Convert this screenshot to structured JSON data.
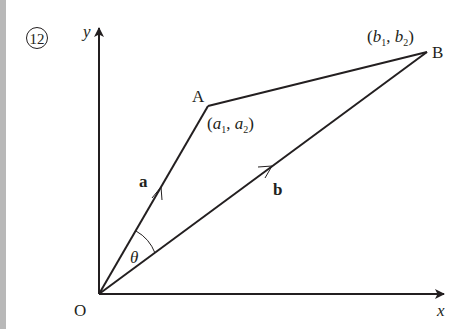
{
  "figure": {
    "number_label": "12",
    "axes": {
      "x_label": "x",
      "y_label": "y",
      "origin_label": "O"
    },
    "points": {
      "A": {
        "label": "A",
        "coord_label": {
          "open": "(",
          "v1": "a",
          "s1": "1",
          "sep": ", ",
          "v2": "a",
          "s2": "2",
          "close": ")"
        }
      },
      "B": {
        "label": "B",
        "coord_label": {
          "open": "(",
          "v1": "b",
          "s1": "1",
          "sep": ", ",
          "v2": "b",
          "s2": "2",
          "close": ")"
        }
      }
    },
    "vectors": {
      "a_label": "a",
      "b_label": "b"
    },
    "angle_label": "θ"
  },
  "colors": {
    "ink": "#231f20",
    "strip": "#b8b8b8",
    "background": "#ffffff"
  }
}
